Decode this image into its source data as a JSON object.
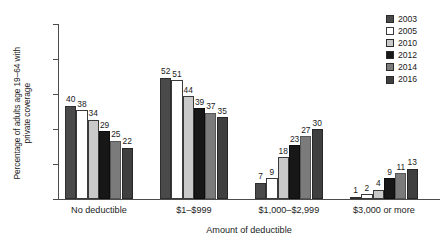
{
  "chart_data": {
    "type": "bar",
    "title": "",
    "subtitle": "",
    "xlabel": "Amount of deductible",
    "ylabel": "Percentage of adults age 19–64 with\nprivate coverage",
    "ylim": [
      0,
      75
    ],
    "yticks": [
      0,
      15,
      30,
      45,
      60,
      75
    ],
    "ytick_labels": [
      "0",
      "15",
      "30",
      "45",
      "60",
      "75"
    ],
    "grid": false,
    "legend_position": "top-right",
    "categories": [
      "No deductible",
      "$1–$999",
      "$1,000–$2,999",
      "$3,000 or more"
    ],
    "series": [
      {
        "name": "2003",
        "color": "#4a4a4a",
        "border": "#2e2e2e",
        "values": [
          40,
          52,
          7,
          1
        ]
      },
      {
        "name": "2005",
        "color": "#ffffff",
        "border": "#3a3a3a",
        "values": [
          38,
          51,
          9,
          2
        ]
      },
      {
        "name": "2010",
        "color": "#c9c9c9",
        "border": "#3a3a3a",
        "values": [
          34,
          44,
          18,
          4
        ]
      },
      {
        "name": "2012",
        "color": "#171717",
        "border": "#0d0d0d",
        "values": [
          29,
          39,
          23,
          9
        ]
      },
      {
        "name": "2014",
        "color": "#7b7b7b",
        "border": "#565656",
        "values": [
          25,
          37,
          27,
          11
        ]
      },
      {
        "name": "2016",
        "color": "#3f3f3f",
        "border": "#272727",
        "values": [
          22,
          35,
          30,
          13
        ]
      }
    ],
    "data_labels": {
      "No deductible": [
        "40",
        "38",
        "34",
        "29",
        "25",
        "22"
      ],
      "$1–$999": [
        "52",
        "51",
        "44",
        "39",
        "37",
        "35"
      ],
      "$1,000–$2,999": [
        "7",
        "9",
        "18",
        "23",
        "27",
        "30"
      ],
      "$3,000 or more": [
        "1",
        "2",
        "4",
        "9",
        "11",
        "13"
      ]
    }
  },
  "legend": {
    "items": [
      {
        "label": "2003",
        "color": "#4a4a4a"
      },
      {
        "label": "2005",
        "color": "#ffffff"
      },
      {
        "label": "2010",
        "color": "#c9c9c9"
      },
      {
        "label": "2012",
        "color": "#171717"
      },
      {
        "label": "2014",
        "color": "#7b7b7b"
      },
      {
        "label": "2016",
        "color": "#3f3f3f"
      }
    ]
  },
  "axes": {
    "y_title": "Percentage of adults age 19–64 with\nprivate coverage",
    "x_title": "Amount of deductible"
  }
}
